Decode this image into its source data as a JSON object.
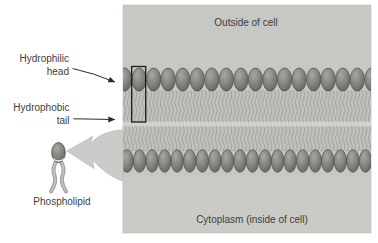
{
  "diagram": {
    "regions": {
      "outside_label": "Outside of cell",
      "inside_label": "Cytoplasm (inside of cell)"
    },
    "labels": {
      "hydrophilic": {
        "line1": "Hydrophilic",
        "line2": "head"
      },
      "hydrophobic": {
        "line1": "Hydrophobic",
        "line2": "tail"
      },
      "phospholipid": "Phospholipid"
    },
    "icons": {
      "hydrophilic_arrow": "thin-arrow-pointing-to-head-row",
      "hydrophobic_arrow": "thin-arrow-pointing-to-tail-region",
      "extraction_arrow": "thick-curved-arrow-from-membrane-to-phospholipid"
    },
    "counts": {
      "top_heads": 18,
      "bottom_heads": 20
    },
    "colors": {
      "page_bg": "#ffffff",
      "membrane_bg": "#c6c8c4",
      "membrane_edge": "#b5b7b3",
      "cytoplasm_bg": "#cacbc7",
      "tail_region_bg": "#c0c2be",
      "tail_strand": "#a4a6a2",
      "gap_band": "#d0d2ce",
      "head_fill_light": "#a7a8a5",
      "head_fill_mid": "#84857f",
      "head_fill_dark": "#646661",
      "head_stroke": "#4e4f4c",
      "highlight_box": "#1b1b1b",
      "label_arrow": "#2b2b2b",
      "extraction_arrow_fill": "#cbccc9",
      "extraction_arrow_edge": "#b9bab7",
      "text": "#3d3d3d"
    }
  }
}
